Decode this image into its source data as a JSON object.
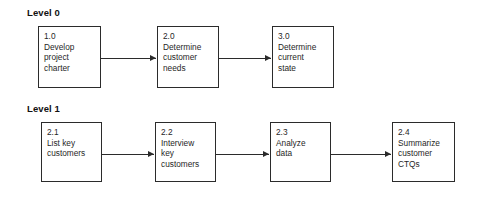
{
  "diagram": {
    "title_level0": "Level 0",
    "title_level1": "Level 1",
    "levels": [
      {
        "label": "Level 0",
        "label_pos": {
          "x": 27,
          "y": 7
        },
        "boxes": [
          {
            "id": "1.0",
            "text": "Develop\nproject\ncharter",
            "x": 38,
            "y": 26,
            "w": 63,
            "h": 62
          },
          {
            "id": "2.0",
            "text": "Determine\ncustomer\nneeds",
            "x": 157,
            "y": 26,
            "w": 62,
            "h": 62
          },
          {
            "id": "3.0",
            "text": "Determine\ncurrent\nstate",
            "x": 272,
            "y": 26,
            "w": 62,
            "h": 62
          }
        ],
        "arrows": [
          {
            "x": 101,
            "y": 55,
            "w": 55
          },
          {
            "x": 219,
            "y": 55,
            "w": 52
          }
        ]
      },
      {
        "label": "Level 1",
        "label_pos": {
          "x": 27,
          "y": 103
        },
        "boxes": [
          {
            "id": "2.1",
            "text": "List key\ncustomers",
            "x": 41,
            "y": 122,
            "w": 61,
            "h": 60
          },
          {
            "id": "2.2",
            "text": "Interview\nkey\ncustomers",
            "x": 155,
            "y": 122,
            "w": 61,
            "h": 60
          },
          {
            "id": "2.3",
            "text": "Analyze\ndata",
            "x": 270,
            "y": 122,
            "w": 61,
            "h": 60
          },
          {
            "id": "2.4",
            "text": "Summarize\ncustomer\nCTQs",
            "x": 392,
            "y": 122,
            "w": 63,
            "h": 60
          }
        ],
        "arrows": [
          {
            "x": 102,
            "y": 151,
            "w": 52
          },
          {
            "x": 216,
            "y": 151,
            "w": 53
          },
          {
            "x": 331,
            "y": 151,
            "w": 60
          }
        ]
      }
    ],
    "colors": {
      "box_border": "#2b2b2b",
      "text": "#1f1f1f",
      "label": "#111111",
      "background": "#ffffff"
    }
  }
}
